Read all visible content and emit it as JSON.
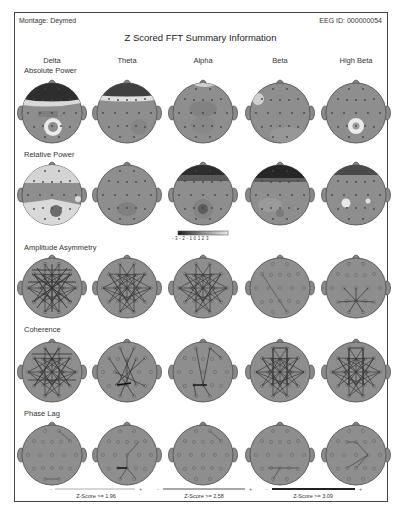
{
  "header": {
    "montage": "Montage: Deymed",
    "eeg_id": "EEG ID: 000000054",
    "title": "Z Scored FFT Summary Information"
  },
  "columns": [
    "Delta",
    "Theta",
    "Alpha",
    "Beta",
    "High Beta"
  ],
  "rows": [
    {
      "label": "Absolute Power",
      "type": "topomap"
    },
    {
      "label": "Relative Power",
      "type": "topomap"
    },
    {
      "label": "Amplitude Asymmetry",
      "type": "connectivity"
    },
    {
      "label": "Coherence",
      "type": "connectivity"
    },
    {
      "label": "Phase Lag",
      "type": "connectivity"
    }
  ],
  "colorbar": {
    "ticks": [
      "-3",
      "-2",
      "-1",
      "0",
      "1",
      "2",
      "3"
    ]
  },
  "legend": [
    {
      "label": "Z-Score >= 1.96"
    },
    {
      "label": "Z-Score >= 2.58"
    },
    {
      "label": "Z-Score >= 3.09"
    }
  ],
  "colors": {
    "head_fill": "#8d8d8d",
    "frame": "#444444",
    "line": "#3a3a3a"
  }
}
